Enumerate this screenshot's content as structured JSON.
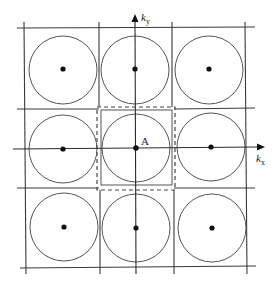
{
  "diagram": {
    "axes": {
      "kx": {
        "label": "k",
        "subscript": "x"
      },
      "ky": {
        "label": "k",
        "subscript": "y"
      }
    },
    "center_point": {
      "label": "A"
    },
    "grid": {
      "rows": 3,
      "cols": 3
    },
    "cells": [
      {
        "row": 0,
        "col": 0,
        "has_circle": true,
        "has_dot": true
      },
      {
        "row": 0,
        "col": 1,
        "has_circle": true,
        "has_dot": true
      },
      {
        "row": 0,
        "col": 2,
        "has_circle": true,
        "has_dot": true
      },
      {
        "row": 1,
        "col": 0,
        "has_circle": true,
        "has_dot": true
      },
      {
        "row": 1,
        "col": 1,
        "has_circle": true,
        "has_dot": true,
        "label": "A",
        "highlighted": "dashed-border"
      },
      {
        "row": 1,
        "col": 2,
        "has_circle": true,
        "has_dot": true
      },
      {
        "row": 2,
        "col": 0,
        "has_circle": true,
        "has_dot": true
      },
      {
        "row": 2,
        "col": 1,
        "has_circle": true,
        "has_dot": true
      },
      {
        "row": 2,
        "col": 2,
        "has_circle": true,
        "has_dot": true
      }
    ],
    "colors": {
      "lines": "#3a3a3a",
      "circles": "#555555",
      "dots": "#111111",
      "background": "#ffffff"
    }
  }
}
